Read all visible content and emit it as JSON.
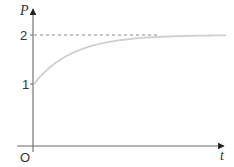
{
  "chart_data": {
    "type": "line",
    "title": "",
    "xlabel": "t",
    "ylabel": "P",
    "origin_label": "O",
    "y_ticks": [
      {
        "value": 1,
        "label": "1"
      },
      {
        "value": 2,
        "label": "2"
      }
    ],
    "x_ticks": [],
    "grid": false,
    "legend": null,
    "series": [
      {
        "name": "P(t)",
        "description": "Exponential approach curve starting at P=1 when t=0, rising and leveling off toward asymptote P=2",
        "formula": "P = 2 - e^(-kt)",
        "x": [
          0,
          0.5,
          1,
          1.5,
          2,
          2.5,
          3,
          4,
          5
        ],
        "values": [
          1.0,
          1.39,
          1.63,
          1.78,
          1.86,
          1.92,
          1.95,
          1.98,
          1.99
        ],
        "color": "#cfcfcf"
      }
    ],
    "annotations": [
      {
        "type": "dashed_horizontal_line",
        "y": 2,
        "description": "Asymptote at P = 2"
      }
    ],
    "ylim": [
      0,
      2.4
    ],
    "xlim": [
      0,
      5.2
    ]
  },
  "labels": {
    "y_axis": "P",
    "x_axis": "t",
    "origin": "O",
    "tick_2": "2",
    "tick_1": "1"
  },
  "colors": {
    "axis": "#6a6a6a",
    "curve": "#cfcfcf",
    "dashed": "#8a8a8a",
    "text": "#333333"
  }
}
